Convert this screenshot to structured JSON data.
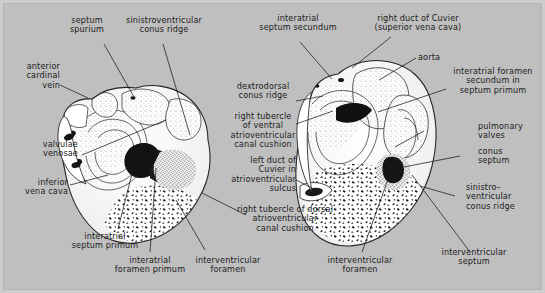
{
  "figure": {
    "domain_kind": "anatomical-diagram",
    "title_visible": "",
    "background_color": "#bfbfbf",
    "ink_color": "#1b1b1b",
    "panels": [
      {
        "name": "left-heart-section",
        "stage_note": ""
      },
      {
        "name": "right-heart-section",
        "stage_note": ""
      }
    ]
  },
  "labels": {
    "septum_spurium": "septum\nspurium",
    "sinistroventricular_conus_ridge_top": "sinistroventricular\nconus ridge",
    "interatrial_septum_secundum": "interatrial\nseptum secundum",
    "right_duct_of_cuvier": "right duct of Cuvier\n(superior vena cava)",
    "anterior_cardinal_vein": "anterior\ncardinal\nvein",
    "dextrodorsal_conus_ridge": "dextrodorsal\nconus ridge",
    "aorta": "aorta",
    "interatrial_foramen_secundum": "interatrial foramen\nsecundum in\nseptum primum",
    "valvulae_venosae": "valvulae\nvenosae",
    "right_tubercle_ventral": "right tubercle\nof ventral\natrioventricular\ncanal cushion",
    "pulmonary_valves": "pulmonary\nvalves",
    "conus_septum": "conus\nseptum",
    "inferior_vena_cava": "inferior\nvena cava",
    "left_duct_of_cuvier": "left duct of\nCuvier in\natrioventricular\nsulcus",
    "sinistroventricular_conus_ridge_right": "sinistro–\nventricular\nconus ridge",
    "right_tubercle_dorsal": "right tubercle of dorsal\natrioventricular\ncanal cushion",
    "interatrial_septum_primum": "interatrial\nseptum primum",
    "interatrial_foramen_primum": "interatrial\nforamen primum",
    "interventricular_foramen_left": "interventricular\nforamen",
    "interventricular_foramen_right": "interventricular\nforamen",
    "interventricular_septum": "interventricular\nseptum"
  },
  "leaders": {
    "count": 21,
    "stroke": "#1b1b1b",
    "stroke_width": 0.7
  }
}
